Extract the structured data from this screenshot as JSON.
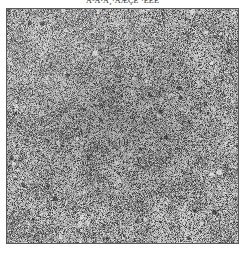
{
  "figure": {
    "caption": "Å³Ä¹Ã¸·ÅÆÇÈ  ·ÉÊË",
    "caption_note": "top caption line is cropped by the image boundary and is not legible",
    "panel": {
      "label": "",
      "alt": "grayscale speckled noise texture panel",
      "border_color": "#5a5a5a",
      "background_color": "#b9b9b9",
      "mean_tone": "#9a9a9a",
      "dark_speckle_color": "#2a2a2a",
      "light_speckle_color": "#ededed",
      "width_px": 233,
      "height_px": 236
    },
    "page_background": "#ffffff"
  }
}
